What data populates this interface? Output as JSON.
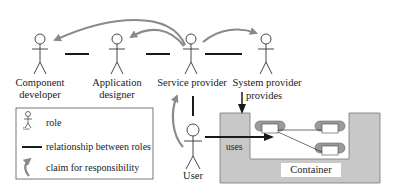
{
  "roles": [
    {
      "id": "component-developer",
      "line1": "Component",
      "line2": "developer"
    },
    {
      "id": "application-designer",
      "line1": "Application",
      "line2": "designer"
    },
    {
      "id": "service-provider",
      "line1": "Service provider",
      "line2": ""
    },
    {
      "id": "system-provider",
      "line1": "System provider",
      "line2": ""
    },
    {
      "id": "user",
      "line1": "User",
      "line2": ""
    }
  ],
  "labels": {
    "provides": "provides",
    "uses": "uses",
    "container": "Container"
  },
  "legend": {
    "role": "role",
    "relationship": "relationship between roles",
    "claim": "claim for responsibility",
    "mini_figure_caption": "User"
  },
  "colors": {
    "arrow": "#8a8a8a",
    "container_fill": "#c8c8c8",
    "component_fill": "#9a9a9a",
    "line": "#1a1a1a"
  }
}
